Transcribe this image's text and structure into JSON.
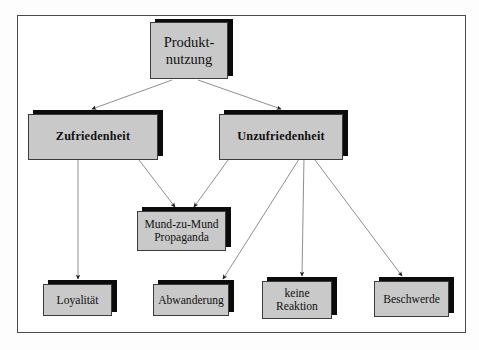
{
  "diagram": {
    "title_text": "Produkt-\nnutzung",
    "frame": {
      "border_color": "#4a4a4a",
      "background": "#ffffff"
    },
    "style": {
      "box_fill": "#c9c9c9",
      "box_border": "#3c3c3c",
      "shadow_color": "#0b0b0b",
      "arrow_color": "#8a8a8a",
      "arrow_head_color": "#1a1a1a"
    },
    "nodes": [
      {
        "id": "produktnutzung",
        "label": "Produkt-\nnutzung",
        "level": 1
      },
      {
        "id": "zufriedenheit",
        "label": "Zufriedenheit",
        "level": 2
      },
      {
        "id": "unzufriedenheit",
        "label": "Unzufriedenheit",
        "level": 2
      },
      {
        "id": "mundzumund",
        "label": "Mund-zu-Mund\nPropaganda",
        "level": 3
      },
      {
        "id": "loyalitaet",
        "label": "Loyalität",
        "level": 4
      },
      {
        "id": "abwanderung",
        "label": "Abwanderung",
        "level": 4
      },
      {
        "id": "keinereaktion",
        "label": "keine\nReaktion",
        "level": 4
      },
      {
        "id": "beschwerde",
        "label": "Beschwerde",
        "level": 4
      }
    ],
    "edges": [
      {
        "from": "produktnutzung",
        "to": "zufriedenheit"
      },
      {
        "from": "produktnutzung",
        "to": "unzufriedenheit"
      },
      {
        "from": "zufriedenheit",
        "to": "loyalitaet"
      },
      {
        "from": "zufriedenheit",
        "to": "mundzumund"
      },
      {
        "from": "unzufriedenheit",
        "to": "mundzumund"
      },
      {
        "from": "unzufriedenheit",
        "to": "abwanderung"
      },
      {
        "from": "unzufriedenheit",
        "to": "keinereaktion"
      },
      {
        "from": "unzufriedenheit",
        "to": "beschwerde"
      }
    ]
  }
}
